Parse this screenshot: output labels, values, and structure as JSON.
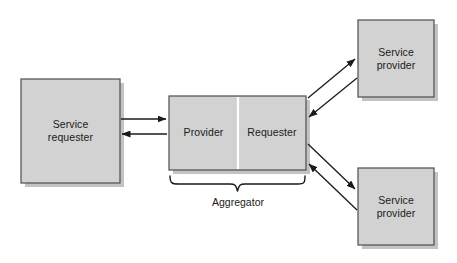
{
  "diagram": {
    "colors": {
      "box_fill": "#d2d2d2",
      "box_stroke": "#4d4d4d",
      "box_shadow": "#bdbdbd",
      "divider": "#ffffff",
      "arrow": "#1a1a1a",
      "text": "#1a1a1a",
      "background": "#ffffff"
    },
    "nodes": [
      {
        "id": "service-requester",
        "label": "Service\nrequester",
        "x": 21,
        "y": 79,
        "w": 99,
        "h": 104
      },
      {
        "id": "provider",
        "label": "Provider",
        "x": 169,
        "y": 96,
        "w": 69,
        "h": 74
      },
      {
        "id": "requester",
        "label": "Requester",
        "x": 238,
        "y": 96,
        "w": 68,
        "h": 74
      },
      {
        "id": "service-provider-top",
        "label": "Service\nprovider",
        "x": 358,
        "y": 20,
        "w": 76,
        "h": 77
      },
      {
        "id": "service-provider-bottom",
        "label": "Service\nprovider",
        "x": 358,
        "y": 168,
        "w": 76,
        "h": 77
      }
    ],
    "group": {
      "id": "aggregator",
      "label": "Aggregator",
      "brace_left": 169,
      "brace_right": 306,
      "brace_top": 175,
      "brace_bottom": 192,
      "label_x": 187,
      "label_y": 195,
      "label_w": 102
    },
    "connections": [
      {
        "id": "requester-to-provider",
        "from": "service-requester",
        "to": "provider",
        "direction": "right",
        "points": "121,119 167,119"
      },
      {
        "id": "provider-to-requester",
        "from": "provider",
        "to": "service-requester",
        "direction": "left",
        "points": "167,134 121,134"
      },
      {
        "id": "requester-to-provider-top",
        "from": "requester",
        "to": "service-provider-top",
        "direction": "up-right",
        "points": "308,97 356,58"
      },
      {
        "id": "provider-top-to-requester",
        "from": "service-provider-top",
        "to": "requester",
        "direction": "down-left",
        "points": "356,77 308,116"
      },
      {
        "id": "requester-to-provider-bottom",
        "from": "requester",
        "to": "service-provider-bottom",
        "direction": "down-right",
        "points": "308,144 356,190"
      },
      {
        "id": "provider-bottom-to-requester",
        "from": "service-provider-bottom",
        "to": "requester",
        "direction": "up-left",
        "points": "356,211 308,164"
      }
    ]
  }
}
